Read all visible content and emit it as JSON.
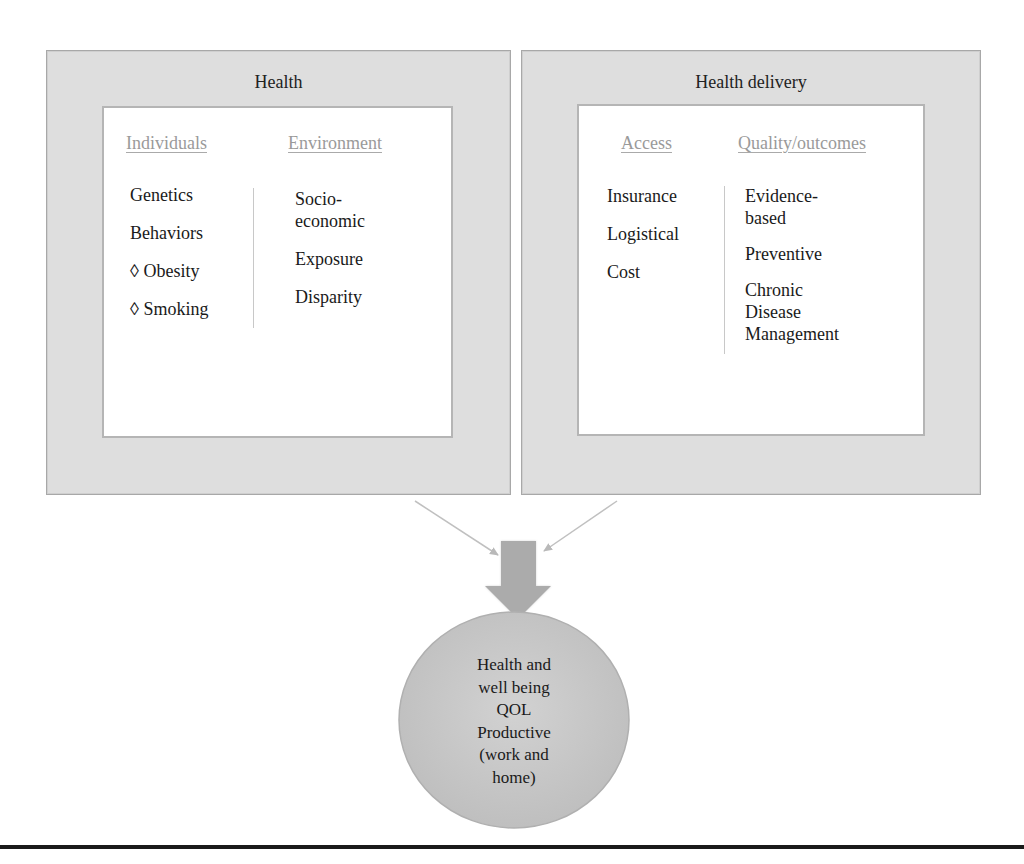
{
  "diagram": {
    "left_panel": {
      "title": "Health",
      "columns": [
        {
          "header": "Individuals",
          "items": [
            "Genetics",
            "Behaviors",
            "◊ Obesity",
            "◊ Smoking"
          ]
        },
        {
          "header": "Environment",
          "items": [
            "Socio-\neconomic",
            "Exposure",
            "Disparity"
          ]
        }
      ]
    },
    "right_panel": {
      "title": "Health delivery",
      "columns": [
        {
          "header": "Access",
          "items": [
            "Insurance",
            "Logistical",
            "Cost"
          ]
        },
        {
          "header": "Quality/outcomes",
          "items": [
            "Evidence-\nbased",
            "Preventive",
            "Chronic\nDisease\nManagement"
          ]
        }
      ]
    },
    "outcome": {
      "lines": [
        "Health and",
        "well being",
        "QOL",
        "Productive",
        "(work and",
        "home)"
      ]
    },
    "colors": {
      "panel_fill": "#dedede",
      "inner_fill": "#ffffff",
      "header_text": "#9a9a9a",
      "arrow": "#a9a9a9",
      "outcome_fill": "#c9c9c9",
      "rule": "#1a1a1a"
    }
  }
}
